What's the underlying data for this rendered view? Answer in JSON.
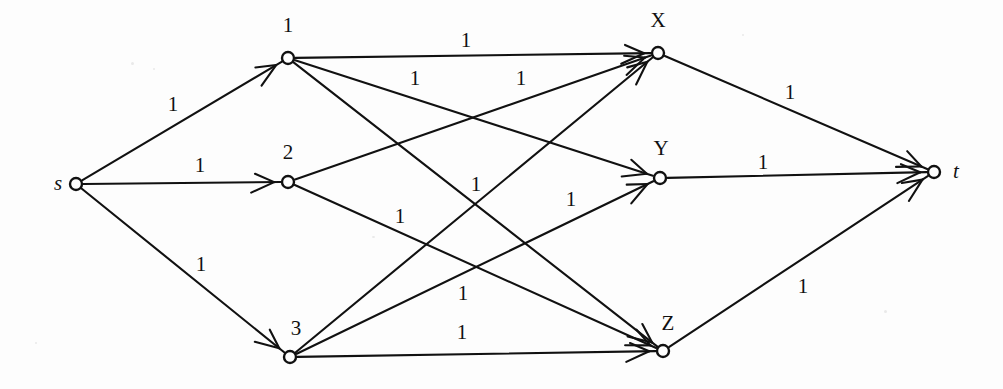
{
  "figure": {
    "kind": "flow-network-diagram",
    "background_color": "#fdfdfd",
    "ink_color": "#111111",
    "width": 1003,
    "height": 389
  },
  "nodes": [
    {
      "id": "s",
      "label": "s",
      "x": 76,
      "y": 184,
      "r": 6,
      "label_x": 58,
      "label_y": 185,
      "italic": true
    },
    {
      "id": "n1",
      "label": "1",
      "x": 288,
      "y": 58,
      "r": 6,
      "label_x": 288,
      "label_y": 27,
      "italic": false
    },
    {
      "id": "n2",
      "label": "2",
      "x": 288,
      "y": 182,
      "r": 6,
      "label_x": 288,
      "label_y": 154,
      "italic": false
    },
    {
      "id": "n3",
      "label": "3",
      "x": 290,
      "y": 357,
      "r": 6,
      "label_x": 296,
      "label_y": 330,
      "italic": false
    },
    {
      "id": "X",
      "label": "X",
      "x": 658,
      "y": 53,
      "r": 6,
      "label_x": 658,
      "label_y": 22,
      "italic": false
    },
    {
      "id": "Y",
      "label": "Y",
      "x": 660,
      "y": 178,
      "r": 6,
      "label_x": 661,
      "label_y": 150,
      "italic": false
    },
    {
      "id": "Z",
      "label": "Z",
      "x": 663,
      "y": 351,
      "r": 6,
      "label_x": 668,
      "label_y": 325,
      "italic": false
    },
    {
      "id": "t",
      "label": "t",
      "x": 934,
      "y": 172,
      "r": 6,
      "label_x": 956,
      "label_y": 173,
      "italic": true
    }
  ],
  "edges": [
    {
      "from": "s",
      "to": "n1",
      "capacity": "1",
      "label_x": 173,
      "label_y": 106
    },
    {
      "from": "s",
      "to": "n2",
      "capacity": "1",
      "label_x": 200,
      "label_y": 167
    },
    {
      "from": "s",
      "to": "n3",
      "capacity": "1",
      "label_x": 201,
      "label_y": 266
    },
    {
      "from": "n1",
      "to": "X",
      "capacity": "1",
      "label_x": 466,
      "label_y": 42
    },
    {
      "from": "n1",
      "to": "Y",
      "capacity": "1",
      "label_x": 476,
      "label_y": 186
    },
    {
      "from": "n1",
      "to": "Z",
      "capacity": "1",
      "label_x": 463,
      "label_y": 295
    },
    {
      "from": "n2",
      "to": "X",
      "capacity": "1",
      "label_x": 521,
      "label_y": 80
    },
    {
      "from": "n2",
      "to": "Z",
      "capacity": "1",
      "label_x": 400,
      "label_y": 218
    },
    {
      "from": "n3",
      "to": "X",
      "capacity": "1",
      "label_x": 415,
      "label_y": 80
    },
    {
      "from": "n3",
      "to": "Y",
      "capacity": "1",
      "label_x": 571,
      "label_y": 201
    },
    {
      "from": "n3",
      "to": "Z",
      "capacity": "1",
      "label_x": 462,
      "label_y": 334
    },
    {
      "from": "X",
      "to": "t",
      "capacity": "1",
      "label_x": 790,
      "label_y": 94
    },
    {
      "from": "Y",
      "to": "t",
      "capacity": "1",
      "label_x": 763,
      "label_y": 164
    },
    {
      "from": "Z",
      "to": "t",
      "capacity": "1",
      "label_x": 803,
      "label_y": 288
    }
  ],
  "chart_data": {
    "type": "diagram",
    "title": "",
    "node_ids": [
      "s",
      "1",
      "2",
      "3",
      "X",
      "Y",
      "Z",
      "t"
    ],
    "edge_list": [
      [
        "s",
        "1"
      ],
      [
        "s",
        "2"
      ],
      [
        "s",
        "3"
      ],
      [
        "1",
        "X"
      ],
      [
        "1",
        "Y"
      ],
      [
        "1",
        "Z"
      ],
      [
        "2",
        "X"
      ],
      [
        "2",
        "Z"
      ],
      [
        "3",
        "X"
      ],
      [
        "3",
        "Y"
      ],
      [
        "3",
        "Z"
      ],
      [
        "X",
        "t"
      ],
      [
        "Y",
        "t"
      ],
      [
        "Z",
        "t"
      ]
    ],
    "edge_capacities": [
      1,
      1,
      1,
      1,
      1,
      1,
      1,
      1,
      1,
      1,
      1,
      1,
      1,
      1
    ],
    "edge_count": 14,
    "node_count": 8
  }
}
